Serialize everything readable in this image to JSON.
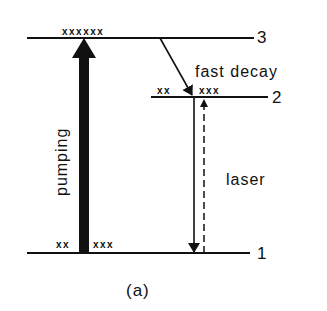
{
  "diagram": {
    "type": "energy-level-diagram",
    "caption": "(a)",
    "levels": [
      {
        "id": "3",
        "label": "3",
        "population_left": "xxxxxx",
        "population_right": ""
      },
      {
        "id": "2",
        "label": "2",
        "population_left": "xx",
        "population_right": "xxx"
      },
      {
        "id": "1",
        "label": "1",
        "population_left": "xx",
        "population_right": "xxx"
      }
    ],
    "transitions": [
      {
        "from": "1",
        "to": "3",
        "label": "pumping",
        "style": "thick-solid"
      },
      {
        "from": "3",
        "to": "2",
        "label": "fast decay",
        "style": "solid"
      },
      {
        "from": "2",
        "to": "1",
        "label": "laser",
        "style": "solid"
      },
      {
        "from": "1",
        "to": "2",
        "label": "",
        "style": "dashed"
      }
    ],
    "colors": {
      "ink": "#111111",
      "background": "#ffffff"
    }
  }
}
